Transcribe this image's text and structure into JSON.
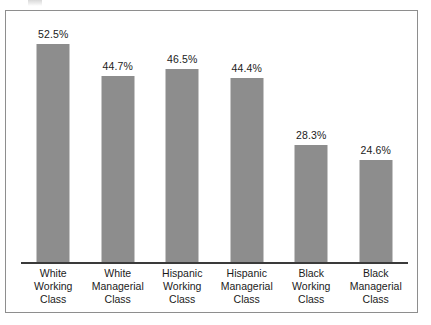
{
  "chart_data": {
    "type": "bar",
    "title": "",
    "subtitle": "",
    "xlabel": "",
    "ylabel": "",
    "ylim": [
      0,
      60
    ],
    "grid": false,
    "legend": "none",
    "orientation": "vertical",
    "value_label_position": "above-bar",
    "bar_color": "#8d8d8d",
    "axis_color": "#3a3a3a",
    "frame_color": "#8e8e8e",
    "text_color": "#1b1b1b",
    "categories": [
      "White Working Class",
      "White Managerial Class",
      "Hispanic Working Class",
      "Hispanic Managerial Class",
      "Black Working Class",
      "Black Managerial Class"
    ],
    "values": [
      52.5,
      44.7,
      46.5,
      44.4,
      28.3,
      24.6
    ],
    "value_labels": [
      "52.5%",
      "44.7%",
      "46.5%",
      "44.4%",
      "28.3%",
      "24.6%"
    ],
    "bars": [
      {
        "value": 52.5,
        "value_label": "52.5%",
        "label_line1": "White",
        "label_line2": "Working",
        "label_line3": "Class"
      },
      {
        "value": 44.7,
        "value_label": "44.7%",
        "label_line1": "White",
        "label_line2": "Managerial",
        "label_line3": "Class"
      },
      {
        "value": 46.5,
        "value_label": "46.5%",
        "label_line1": "Hispanic",
        "label_line2": "Working",
        "label_line3": "Class"
      },
      {
        "value": 44.4,
        "value_label": "44.4%",
        "label_line1": "Hispanic",
        "label_line2": "Managerial",
        "label_line3": "Class"
      },
      {
        "value": 28.3,
        "value_label": "28.3%",
        "label_line1": "Black",
        "label_line2": "Working",
        "label_line3": "Class"
      },
      {
        "value": 24.6,
        "value_label": "24.6%",
        "label_line1": "Black",
        "label_line2": "Managerial",
        "label_line3": "Class"
      }
    ]
  }
}
